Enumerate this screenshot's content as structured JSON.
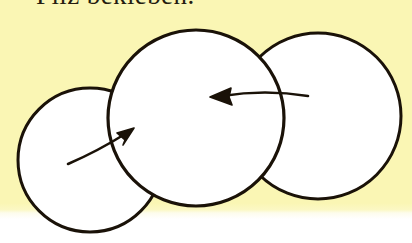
{
  "page": {
    "kind": "scanned-worksheet-fragment",
    "width": 412,
    "height": 243,
    "paper_color": "#faf6b4",
    "margin_color": "#ffffff",
    "ink_color": "#1a1208",
    "fill_color": "#ffffff",
    "paper_field_height": 212
  },
  "heading": {
    "text": "Pilz bekleben.",
    "note": "top of glyphs cropped by image edge",
    "color": "#241c10"
  },
  "figure": {
    "name": "drei-ueberlappende-kreise",
    "circles": [
      {
        "id": "left",
        "cx": 90,
        "cy": 160,
        "r": 72,
        "stroke": "#1a1208",
        "stroke_width": 3.0,
        "fill": "#ffffff"
      },
      {
        "id": "middle",
        "cx": 196,
        "cy": 118,
        "r": 88,
        "stroke": "#1a1208",
        "stroke_width": 3.2,
        "fill": "#ffffff"
      },
      {
        "id": "right",
        "cx": 318,
        "cy": 116,
        "r": 83,
        "stroke": "#1a1208",
        "stroke_width": 3.0,
        "fill": "#ffffff"
      }
    ],
    "arrows": [
      {
        "id": "arrow-left",
        "direction": "up-right",
        "from": {
          "x": 68,
          "y": 164
        },
        "to": {
          "x": 133,
          "y": 129
        },
        "stroke": "#1a1208"
      },
      {
        "id": "arrow-right",
        "direction": "left",
        "from": {
          "x": 308,
          "y": 95
        },
        "to": {
          "x": 210,
          "y": 97
        },
        "stroke": "#1a1208"
      }
    ]
  }
}
